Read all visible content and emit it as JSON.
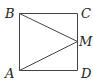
{
  "diagram": {
    "points": {
      "A": {
        "label": "A",
        "x": 19,
        "y": 70
      },
      "B": {
        "label": "B",
        "x": 19,
        "y": 13
      },
      "C": {
        "label": "C",
        "x": 77,
        "y": 13
      },
      "D": {
        "label": "D",
        "x": 77,
        "y": 70
      },
      "M": {
        "label": "M",
        "x": 77,
        "y": 41
      }
    },
    "segments": [
      [
        "A",
        "B"
      ],
      [
        "B",
        "C"
      ],
      [
        "C",
        "D"
      ],
      [
        "D",
        "A"
      ],
      [
        "B",
        "M"
      ],
      [
        "A",
        "M"
      ]
    ],
    "stroke_color": "#444444",
    "label_color": "#222222"
  }
}
